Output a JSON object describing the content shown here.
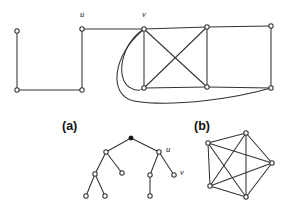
{
  "figure": {
    "background_color": "#ffffff",
    "stroke_color": "#333333",
    "panels": [
      {
        "id": "top",
        "label": ""
      },
      {
        "id": "a",
        "label": "(a)"
      },
      {
        "id": "b",
        "label": "(b)"
      }
    ]
  },
  "top_graph": {
    "title": "",
    "vertex_labels": [
      {
        "name": "u",
        "text": "u",
        "x": 80,
        "y": 17
      },
      {
        "name": "v",
        "text": "v",
        "x": 142,
        "y": 17
      }
    ],
    "vertices": [
      {
        "id": "n1",
        "x": 17,
        "y": 31,
        "filled": false
      },
      {
        "id": "n2",
        "x": 17,
        "y": 90,
        "filled": false
      },
      {
        "id": "n3",
        "x": 82,
        "y": 90,
        "filled": false
      },
      {
        "id": "u",
        "x": 82,
        "y": 29,
        "filled": false
      },
      {
        "id": "v",
        "x": 144,
        "y": 29,
        "filled": false
      },
      {
        "id": "n6",
        "x": 207,
        "y": 27,
        "filled": false
      },
      {
        "id": "n7",
        "x": 271,
        "y": 26,
        "filled": false
      },
      {
        "id": "n8",
        "x": 144,
        "y": 88,
        "filled": false
      },
      {
        "id": "n9",
        "x": 207,
        "y": 87,
        "filled": false
      },
      {
        "id": "n10",
        "x": 271,
        "y": 88,
        "filled": false
      }
    ],
    "straight_edges": [
      [
        "n1",
        "n2"
      ],
      [
        "n2",
        "n3"
      ],
      [
        "n3",
        "u"
      ],
      [
        "u",
        "v"
      ],
      [
        "v",
        "n6"
      ],
      [
        "n6",
        "n7"
      ],
      [
        "n7",
        "n10"
      ],
      [
        "n6",
        "n9"
      ],
      [
        "v",
        "n8"
      ],
      [
        "v",
        "n9"
      ],
      [
        "n8",
        "n6"
      ],
      [
        "n8",
        "n9"
      ],
      [
        "n9",
        "n10"
      ]
    ],
    "curved_edges": [
      {
        "from": "v",
        "to": "n8",
        "description": "small loop curving left and down"
      },
      {
        "from": "v",
        "to": "n10",
        "description": "large sweeping curve under graph"
      }
    ]
  },
  "panel_a": {
    "label": "(a)",
    "label_x": 62,
    "label_y": 130,
    "vertex_labels": [
      {
        "name": "u",
        "text": "u",
        "x": 166,
        "y": 152
      },
      {
        "name": "v",
        "text": "v",
        "x": 180,
        "y": 175
      }
    ],
    "vertices": [
      {
        "id": "root",
        "x": 131,
        "y": 138,
        "filled": true
      },
      {
        "id": "l1",
        "x": 106,
        "y": 152,
        "filled": false
      },
      {
        "id": "r1",
        "x": 159,
        "y": 152,
        "filled": false
      },
      {
        "id": "l2",
        "x": 95,
        "y": 174,
        "filled": false
      },
      {
        "id": "l3",
        "x": 122,
        "y": 173,
        "filled": false
      },
      {
        "id": "l4",
        "x": 86,
        "y": 196,
        "filled": false
      },
      {
        "id": "l5",
        "x": 105,
        "y": 196,
        "filled": false
      },
      {
        "id": "r2",
        "x": 150,
        "y": 175,
        "filled": false
      },
      {
        "id": "r3",
        "x": 174,
        "y": 175,
        "filled": false
      },
      {
        "id": "r4",
        "x": 150,
        "y": 196,
        "filled": false
      }
    ],
    "edges": [
      [
        "root",
        "l1"
      ],
      [
        "root",
        "r1"
      ],
      [
        "l1",
        "l2"
      ],
      [
        "l1",
        "l3"
      ],
      [
        "l2",
        "l4"
      ],
      [
        "l2",
        "l5"
      ],
      [
        "r1",
        "r2"
      ],
      [
        "r1",
        "r3"
      ],
      [
        "r2",
        "r4"
      ]
    ]
  },
  "panel_b": {
    "label": "(b)",
    "label_x": 194,
    "label_y": 130,
    "graph_type": "complete-graph-K5",
    "vertices": [
      {
        "id": "b1",
        "x": 246,
        "y": 133,
        "filled": false
      },
      {
        "id": "b2",
        "x": 208,
        "y": 143,
        "filled": false
      },
      {
        "id": "b3",
        "x": 272,
        "y": 163,
        "filled": false
      },
      {
        "id": "b4",
        "x": 210,
        "y": 186,
        "filled": false
      },
      {
        "id": "b5",
        "x": 246,
        "y": 197,
        "filled": false
      }
    ],
    "edges": [
      [
        "b1",
        "b2"
      ],
      [
        "b1",
        "b3"
      ],
      [
        "b1",
        "b4"
      ],
      [
        "b1",
        "b5"
      ],
      [
        "b2",
        "b3"
      ],
      [
        "b2",
        "b4"
      ],
      [
        "b2",
        "b5"
      ],
      [
        "b3",
        "b4"
      ],
      [
        "b3",
        "b5"
      ],
      [
        "b4",
        "b5"
      ]
    ]
  }
}
